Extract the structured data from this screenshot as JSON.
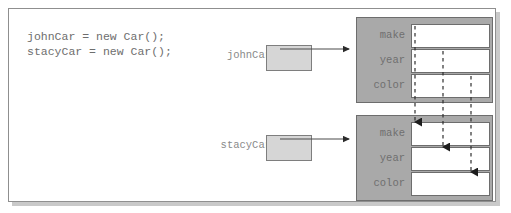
{
  "diagram": {
    "code": {
      "lines": [
        "johnCar = new Car();",
        "stacyCar = new Car();"
      ],
      "text": "johnCar = new Car();\nstacyCar = new Car();"
    },
    "variables": [
      {
        "name": "johnCar",
        "value": ""
      },
      {
        "name": "stacyCar",
        "value": ""
      }
    ],
    "objects": [
      {
        "label": "Car instance 1",
        "fields": [
          {
            "name": "make",
            "value": ""
          },
          {
            "name": "year",
            "value": ""
          },
          {
            "name": "color",
            "value": ""
          }
        ]
      },
      {
        "label": "Car instance 2",
        "fields": [
          {
            "name": "make",
            "value": ""
          },
          {
            "name": "year",
            "value": ""
          },
          {
            "name": "color",
            "value": ""
          }
        ]
      }
    ],
    "colors": {
      "frame_border": "#8f8f8f",
      "frame_shadow": "#c9c9c9",
      "object_fill": "#a9a9a9",
      "object_border": "#6d6d6d",
      "variable_fill": "#d6d6d6",
      "variable_border": "#7e7e7e",
      "field_fill": "#ffffff",
      "text": "#6e6e6e",
      "arrow": "#2b2b2b"
    },
    "connectors": {
      "reference_arrows": 2,
      "dashed_links": 3
    }
  }
}
